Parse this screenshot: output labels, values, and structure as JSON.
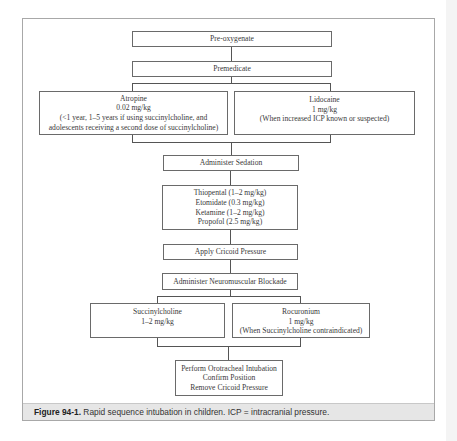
{
  "flowchart": {
    "steps": {
      "preoxygenate": "Pre-oxygenate",
      "premedicate": "Premedicate",
      "atropine": [
        "Atropine",
        "0.02 mg/kg",
        "(<1 year, 1–5 years if using succinylcholine, and",
        "adolescents receiving a second dose of succinylcholine)"
      ],
      "lidocaine": [
        "Lidocaine",
        "1 mg/kg",
        "(When increased ICP known or suspected)"
      ],
      "sedation": "Administer Sedation",
      "sedatives": [
        "Thiopental (1–2 mg/kg)",
        "Etomidate (0.3 mg/kg)",
        "Ketamine (1–2 mg/kg)",
        "Propofol (2.5 mg/kg)"
      ],
      "cricoid": "Apply Cricoid Pressure",
      "blockade": "Administer Neuromuscular Blockade",
      "succinylcholine": [
        "Succinylcholine",
        "1–2 mg/kg"
      ],
      "rocuronium": [
        "Rocuronium",
        "1 mg/kg",
        "(When Succinylcholine contraindicated)"
      ],
      "intubation": [
        "Perform Orotracheal Intubation",
        "Confirm Position",
        "Remove Cricoid Pressure"
      ]
    }
  },
  "caption": {
    "label": "Figure 94-1.",
    "text": " Rapid sequence intubation in children. ICP = intracranial pressure."
  }
}
